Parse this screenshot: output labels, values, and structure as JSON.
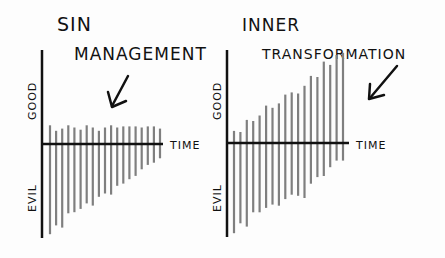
{
  "left_panel": {
    "title_line1": "SIN",
    "title_line2": "MANAGEMENT",
    "y_top_label": "GOOD",
    "y_bottom_label": "EVIL",
    "x_label": "TIME"
  },
  "right_panel": {
    "title_line1": "INNER",
    "title_line2": "TRANSFORMATION",
    "y_top_label": "GOOD",
    "y_bottom_label": "EVIL",
    "x_label": "TIME"
  },
  "chart_data": [
    {
      "type": "bar",
      "title": "Sin Management",
      "xlabel": "Time",
      "ylabel": "Good / Evil",
      "description": "Good stays roughly flat and small; evil shrinks over time",
      "series": [
        {
          "name": "good",
          "values": [
            17,
            12,
            14,
            17,
            15,
            13,
            17,
            15,
            12,
            15,
            17,
            15,
            16,
            16,
            16,
            15,
            16,
            16,
            14
          ]
        },
        {
          "name": "evil",
          "values": [
            -82,
            -74,
            -76,
            -63,
            -62,
            -59,
            -54,
            -56,
            -48,
            -45,
            -46,
            -38,
            -36,
            -32,
            -29,
            -23,
            -19,
            -17,
            -13
          ]
        }
      ],
      "colors": {
        "bars": "#7f7f7f",
        "axes": "#111111"
      }
    },
    {
      "type": "bar",
      "title": "Inner Transformation",
      "xlabel": "Time",
      "ylabel": "Good / Evil",
      "description": "Good grows steadily; evil shrinks over time",
      "series": [
        {
          "name": "good",
          "values": [
            11,
            10,
            21,
            20,
            25,
            34,
            32,
            36,
            44,
            46,
            45,
            52,
            61,
            60,
            74,
            71,
            80,
            82
          ]
        },
        {
          "name": "evil",
          "values": [
            -82,
            -73,
            -76,
            -63,
            -63,
            -59,
            -56,
            -57,
            -51,
            -47,
            -48,
            -50,
            -37,
            -31,
            -30,
            -22,
            -16,
            -16
          ]
        }
      ],
      "colors": {
        "bars": "#7f7f7f",
        "axes": "#111111"
      }
    }
  ]
}
